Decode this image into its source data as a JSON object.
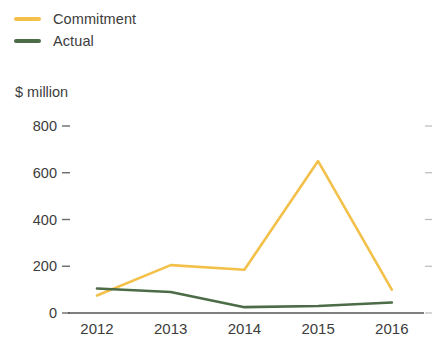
{
  "legend": {
    "position": "top-left",
    "items": [
      {
        "label": "Commitment",
        "color": "#f3c04a",
        "swatch_name": "commitment-swatch"
      },
      {
        "label": "Actual",
        "color": "#4c6b47",
        "swatch_name": "actual-swatch"
      }
    ]
  },
  "axis_unit_label": "$ million",
  "chart_data": {
    "type": "line",
    "title": "",
    "subtitle": "",
    "xlabel": "",
    "ylabel": "$ million",
    "categories": [
      "2012",
      "2013",
      "2014",
      "2015",
      "2016"
    ],
    "x": [
      2012,
      2013,
      2014,
      2015,
      2016
    ],
    "series": [
      {
        "name": "Commitment",
        "color": "#f3c04a",
        "values": [
          75,
          205,
          185,
          650,
          100
        ]
      },
      {
        "name": "Actual",
        "color": "#4c6b47",
        "values": [
          105,
          90,
          25,
          30,
          45
        ]
      }
    ],
    "ylim": [
      0,
      800
    ],
    "yticks": [
      0,
      200,
      400,
      600,
      800
    ],
    "ytick_labels": [
      "0",
      "200",
      "400",
      "600",
      "800"
    ],
    "xtick_labels": [
      "2012",
      "2013",
      "2014",
      "2015",
      "2016"
    ],
    "grid": false,
    "legend_position": "top-left"
  }
}
